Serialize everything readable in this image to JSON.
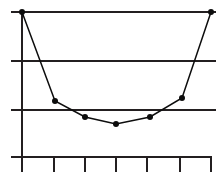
{
  "chart_data": {
    "type": "line",
    "title": "",
    "subtitle": "",
    "xlabel": "",
    "ylabel": "",
    "x": [
      0,
      1,
      2,
      3,
      4,
      5,
      6
    ],
    "values": [
      3.0,
      1.15,
      0.82,
      0.68,
      0.82,
      1.2,
      3.0
    ],
    "series": [
      {
        "name": "",
        "values": [
          3.0,
          1.15,
          0.82,
          0.68,
          0.82,
          1.2,
          3.0
        ]
      }
    ],
    "categories": [
      "",
      "",
      "",
      "",
      "",
      "",
      ""
    ],
    "xtick_labels": [
      "",
      "",
      "",
      "",
      "",
      "",
      ""
    ],
    "ytick_labels": [
      "",
      "",
      "",
      ""
    ],
    "xlim": [
      0,
      6
    ],
    "ylim": [
      0,
      3
    ],
    "grid": "horizontal",
    "gridline_values": [
      3,
      2,
      1
    ],
    "legend": "none",
    "marker": "filled-circle",
    "marker_size": 3,
    "line_color": "#0d0d0d",
    "grid_color": "#231f20",
    "axis_color": "#231f20",
    "background_color": "#ffffff",
    "annotations": []
  },
  "geometry": {
    "width": 221,
    "height": 177,
    "plot_left": 11,
    "plot_right": 216,
    "axis_x": 22,
    "axis_y": 157,
    "axis_top": 10,
    "axis_bottom": 172,
    "axis_right": 212,
    "tick_length": 15,
    "gridlines_y": [
      12,
      61,
      110
    ],
    "ticks_x": [
      22,
      54,
      85,
      116,
      147,
      180,
      211
    ],
    "points": [
      {
        "x": 22,
        "y": 12
      },
      {
        "x": 55,
        "y": 101
      },
      {
        "x": 85,
        "y": 117
      },
      {
        "x": 116,
        "y": 124
      },
      {
        "x": 150,
        "y": 117
      },
      {
        "x": 182,
        "y": 98
      },
      {
        "x": 211,
        "y": 12
      }
    ]
  }
}
